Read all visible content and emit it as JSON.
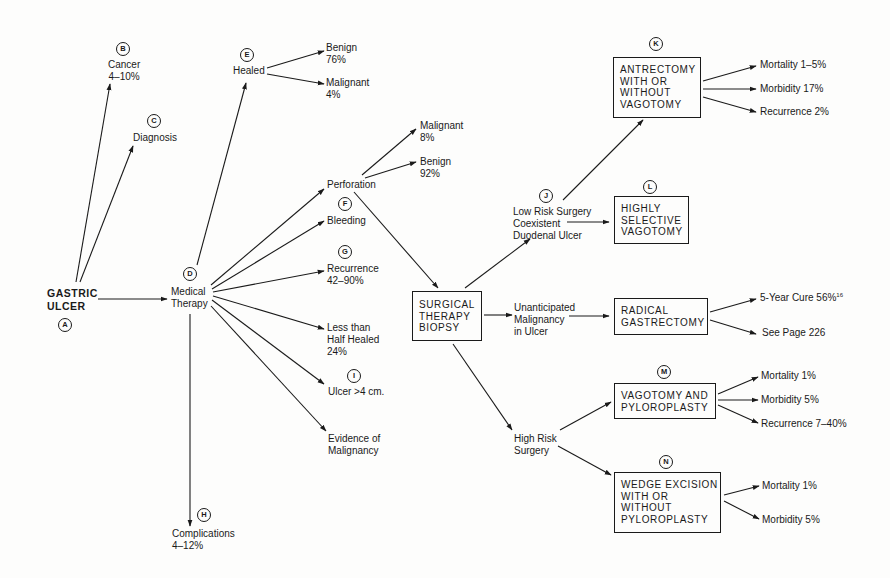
{
  "diagram": {
    "type": "clinical-decision-flowchart",
    "nodes": {
      "A": {
        "letter": "A",
        "label": "GASTRIC\nULCER"
      },
      "B": {
        "letter": "B",
        "label": "Cancer\n4–10%"
      },
      "C": {
        "letter": "C",
        "label": "Diagnosis"
      },
      "D": {
        "letter": "D",
        "label": "Medical\nTherapy"
      },
      "E": {
        "letter": "E",
        "label": "Healed"
      },
      "healed_benign": {
        "label": "Benign\n76%"
      },
      "healed_malignant": {
        "label": "Malignant\n4%"
      },
      "perforation": {
        "label": "Perforation"
      },
      "perf_malignant": {
        "label": "Malignant\n8%"
      },
      "perf_benign": {
        "label": "Benign\n92%"
      },
      "F": {
        "letter": "F",
        "label": "Bleeding"
      },
      "G": {
        "letter": "G",
        "label": "Recurrence\n42–90%"
      },
      "half_healed": {
        "label": "Less than\nHalf Healed\n24%"
      },
      "I": {
        "letter": "I",
        "label": "Ulcer >4 cm."
      },
      "evidence": {
        "label": "Evidence of\nMalignancy"
      },
      "H": {
        "letter": "H",
        "label": "Complications\n4–12%"
      },
      "surgical": {
        "label": "SURGICAL\nTHERAPY\nBIOPSY"
      },
      "J": {
        "letter": "J",
        "label": "Low Risk Surgery\nCoexistent\nDuodenal Ulcer"
      },
      "unanticipated": {
        "label": "Unanticipated\nMalignancy\nin Ulcer"
      },
      "high_risk": {
        "label": "High Risk\nSurgery"
      },
      "K": {
        "letter": "K",
        "label": "ANTRECTOMY\nWITH OR\nWITHOUT\nVAGOTOMY"
      },
      "K_mortality": {
        "label": "Mortality 1–5%"
      },
      "K_morbidity": {
        "label": "Morbidity 17%"
      },
      "K_recurrence": {
        "label": "Recurrence 2%"
      },
      "L": {
        "letter": "L",
        "label": "HIGHLY\nSELECTIVE\nVAGOTOMY"
      },
      "radical": {
        "label": "RADICAL\nGASTRECTOMY"
      },
      "radical_cure": {
        "label": "5-Year Cure 56%",
        "superscript": "16"
      },
      "radical_page": {
        "label": "See Page 226"
      },
      "M": {
        "letter": "M",
        "label": "VAGOTOMY AND\nPYLOROPLASTY"
      },
      "M_mortality": {
        "label": "Mortality 1%"
      },
      "M_morbidity": {
        "label": "Morbidity 5%"
      },
      "M_recurrence": {
        "label": "Recurrence 7–40%"
      },
      "N": {
        "letter": "N",
        "label": "WEDGE EXCISION\nWITH OR\nWITHOUT\nPYLOROPLASTY"
      },
      "N_mortality": {
        "label": "Mortality 1%"
      },
      "N_morbidity": {
        "label": "Morbidity 5%"
      }
    },
    "edges": [
      [
        "A",
        "B"
      ],
      [
        "A",
        "C"
      ],
      [
        "A",
        "D"
      ],
      [
        "D",
        "E"
      ],
      [
        "E",
        "healed_benign"
      ],
      [
        "E",
        "healed_malignant"
      ],
      [
        "D",
        "perforation"
      ],
      [
        "D",
        "F"
      ],
      [
        "D",
        "G"
      ],
      [
        "D",
        "half_healed"
      ],
      [
        "D",
        "I"
      ],
      [
        "D",
        "evidence"
      ],
      [
        "D",
        "H"
      ],
      [
        "perforation",
        "perf_malignant"
      ],
      [
        "perforation",
        "perf_benign"
      ],
      [
        "perforation",
        "surgical"
      ],
      [
        "surgical",
        "J"
      ],
      [
        "surgical",
        "unanticipated"
      ],
      [
        "surgical",
        "high_risk"
      ],
      [
        "J",
        "K"
      ],
      [
        "J",
        "L"
      ],
      [
        "unanticipated",
        "radical"
      ],
      [
        "high_risk",
        "M"
      ],
      [
        "high_risk",
        "N"
      ],
      [
        "K",
        "K_mortality"
      ],
      [
        "K",
        "K_morbidity"
      ],
      [
        "K",
        "K_recurrence"
      ],
      [
        "radical",
        "radical_cure"
      ],
      [
        "radical",
        "radical_page"
      ],
      [
        "M",
        "M_mortality"
      ],
      [
        "M",
        "M_morbidity"
      ],
      [
        "M",
        "M_recurrence"
      ],
      [
        "N",
        "N_mortality"
      ],
      [
        "N",
        "N_morbidity"
      ]
    ]
  }
}
